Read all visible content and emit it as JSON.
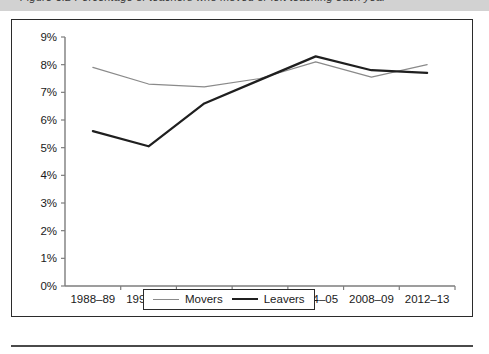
{
  "page": {
    "top_band_text": "Figure 3.2   Percentage of teachers who moved or left teaching each year"
  },
  "legend": {
    "position": "bottom-center",
    "entries": [
      {
        "name": "movers",
        "label": "Movers",
        "color": "#8a8a8a",
        "width": 1.2
      },
      {
        "name": "leavers",
        "label": "Leavers",
        "color": "#1f1f1f",
        "width": 2.2
      }
    ]
  },
  "chart_data": {
    "type": "line",
    "title": "",
    "subtitle": "",
    "xlabel": "",
    "ylabel": "",
    "grid": false,
    "ylim": [
      0,
      9
    ],
    "ytick_values": [
      0,
      1,
      2,
      3,
      4,
      5,
      6,
      7,
      8,
      9
    ],
    "ytick_labels": [
      "0%",
      "1%",
      "2%",
      "3%",
      "4%",
      "5%",
      "6%",
      "7%",
      "8%",
      "9%"
    ],
    "categories": [
      "1988–89",
      "1991–92",
      "1993–94",
      "2000–01",
      "2004–05",
      "2008–09",
      "2012–13"
    ],
    "series": [
      {
        "name": "Movers",
        "color": "#8a8a8a",
        "width": 1.2,
        "values": [
          7.9,
          7.3,
          7.2,
          7.5,
          8.1,
          7.55,
          8.0
        ]
      },
      {
        "name": "Leavers",
        "color": "#1f1f1f",
        "width": 2.2,
        "values": [
          5.6,
          5.05,
          6.6,
          7.45,
          8.3,
          7.8,
          7.7
        ]
      }
    ]
  }
}
